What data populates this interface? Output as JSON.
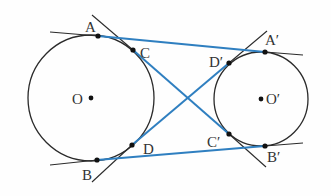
{
  "figure": {
    "colors": {
      "circle": "#2b2b2b",
      "tangent_line": "#2b2b2b",
      "segment": "#2f7fc0",
      "point": "#111111",
      "label": "#333333"
    },
    "circles": [
      {
        "name": "O",
        "label": "O"
      },
      {
        "name": "O_prime",
        "label": "O′"
      }
    ],
    "points": {
      "A": "A",
      "B": "B",
      "C": "C",
      "D": "D",
      "A_prime": "A′",
      "B_prime": "B′",
      "C_prime": "C′",
      "D_prime": "D′",
      "O": "O",
      "O_prime": "O′"
    },
    "blue_segments": [
      "AA′",
      "BB′",
      "CC′",
      "DD′"
    ]
  }
}
